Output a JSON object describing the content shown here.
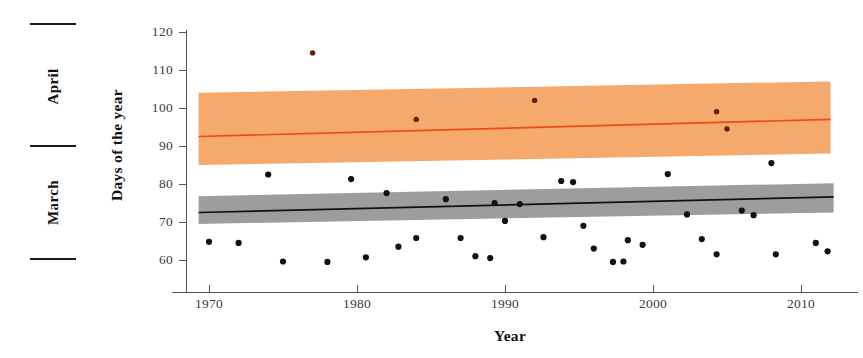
{
  "chart_data": {
    "type": "scatter",
    "title": "",
    "xlabel": "Year",
    "ylabel": "Days of the year",
    "xlim": [
      1968.5,
      2012.5
    ],
    "ylim": [
      55,
      122
    ],
    "xticks": [
      1970,
      1980,
      1990,
      2000,
      2010
    ],
    "yticks": [
      60,
      70,
      80,
      90,
      100,
      110,
      120
    ],
    "grid": false,
    "legend": false,
    "secondary_axis": {
      "name": "month-bracket-axis",
      "labels": [
        "April",
        "March"
      ],
      "bracket_values": [
        120.5,
        88.5,
        59.0
      ]
    },
    "series": [
      {
        "name": "April (flowering) dates",
        "color": "#8a2208",
        "band_color": "#f6a96c",
        "trend_color": "#ec4a16",
        "trend": {
          "x": [
            1969.3,
            2012.0
          ],
          "y": [
            92.5,
            97.0
          ]
        },
        "band": {
          "x": [
            1969.3,
            2012.0
          ],
          "lower": [
            85.0,
            88.0
          ],
          "upper": [
            104.0,
            107.0
          ]
        },
        "points": [
          {
            "x": 1977.0,
            "y": 114.5
          },
          {
            "x": 1984.0,
            "y": 97.0
          },
          {
            "x": 1992.0,
            "y": 102.0
          },
          {
            "x": 2004.3,
            "y": 99.0
          },
          {
            "x": 2005.0,
            "y": 94.5
          }
        ]
      },
      {
        "name": "March (budburst) dates",
        "color": "#111111",
        "band_color": "#9d9d9d",
        "trend_color": "#111111",
        "trend": {
          "x": [
            1969.3,
            2012.2
          ],
          "y": [
            72.5,
            76.6
          ]
        },
        "band": {
          "x": [
            1969.3,
            2012.2
          ],
          "lower": [
            69.5,
            72.5
          ],
          "upper": [
            76.8,
            80.2
          ]
        },
        "points": [
          {
            "x": 1970.0,
            "y": 64.8
          },
          {
            "x": 1972.0,
            "y": 64.5
          },
          {
            "x": 1974.0,
            "y": 82.5
          },
          {
            "x": 1975.0,
            "y": 59.6
          },
          {
            "x": 1978.0,
            "y": 59.5
          },
          {
            "x": 1979.6,
            "y": 81.3
          },
          {
            "x": 1980.6,
            "y": 60.7
          },
          {
            "x": 1982.0,
            "y": 77.6
          },
          {
            "x": 1982.8,
            "y": 63.5
          },
          {
            "x": 1984.0,
            "y": 65.8
          },
          {
            "x": 1986.0,
            "y": 76.0
          },
          {
            "x": 1987.0,
            "y": 65.8
          },
          {
            "x": 1988.0,
            "y": 61.0
          },
          {
            "x": 1989.0,
            "y": 60.5
          },
          {
            "x": 1989.3,
            "y": 75.0
          },
          {
            "x": 1990.0,
            "y": 70.3
          },
          {
            "x": 1991.0,
            "y": 74.7
          },
          {
            "x": 1992.6,
            "y": 66.0
          },
          {
            "x": 1993.8,
            "y": 80.8
          },
          {
            "x": 1994.6,
            "y": 80.5
          },
          {
            "x": 1995.3,
            "y": 69.0
          },
          {
            "x": 1996.0,
            "y": 63.0
          },
          {
            "x": 1997.3,
            "y": 59.5
          },
          {
            "x": 1998.0,
            "y": 59.6
          },
          {
            "x": 1998.3,
            "y": 65.2
          },
          {
            "x": 1999.3,
            "y": 64.0
          },
          {
            "x": 2001.0,
            "y": 82.6
          },
          {
            "x": 2002.3,
            "y": 72.0
          },
          {
            "x": 2003.3,
            "y": 65.5
          },
          {
            "x": 2004.3,
            "y": 61.5
          },
          {
            "x": 2006.0,
            "y": 73.0
          },
          {
            "x": 2006.8,
            "y": 71.8
          },
          {
            "x": 2008.0,
            "y": 85.5
          },
          {
            "x": 2008.3,
            "y": 61.5
          },
          {
            "x": 2011.0,
            "y": 64.5
          },
          {
            "x": 2011.8,
            "y": 62.3
          }
        ]
      }
    ]
  },
  "axes": {
    "y_label": "Days of the year",
    "x_label": "Year",
    "y_ticks": [
      "120",
      "110",
      "100",
      "90",
      "80",
      "70",
      "60"
    ],
    "x_ticks": [
      "1970",
      "1980",
      "1990",
      "2000",
      "2010"
    ],
    "month_labels": [
      "April",
      "March"
    ]
  },
  "colors": {
    "orange_band": "#f6a96c",
    "orange_line": "#ec4a16",
    "gray_band": "#9d9d9d",
    "black_line": "#111111",
    "dot": "#111111",
    "dot_orange": "#6d1a08",
    "axis": "#555555",
    "text": "#3a3a3a"
  }
}
